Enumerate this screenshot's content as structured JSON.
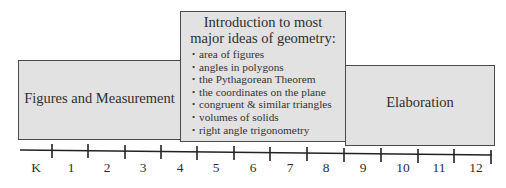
{
  "diagram": {
    "type": "timeline-with-stage-boxes",
    "colors": {
      "box_fill": "#e2e2e2",
      "box_border": "#4a4a4a",
      "line": "#222222",
      "text": "#2e2e2e"
    },
    "stages": [
      {
        "id": "figures-and-measurement",
        "title": "Figures and Measurement",
        "grade_span": [
          "K",
          "4"
        ]
      },
      {
        "id": "introduction",
        "heading_line1": "Introduction to most",
        "heading_line2": "major ideas of geometry:",
        "grade_span": [
          "5",
          "8"
        ],
        "bullets": [
          "area of figures",
          "angles in polygons",
          "the Pythagorean Theorem",
          "the coordinates on the plane",
          "congruent & similar triangles",
          "volumes of solids",
          "right angle trigonometry"
        ]
      },
      {
        "id": "elaboration",
        "title": "Elaboration",
        "grade_span": [
          "9",
          "12"
        ]
      }
    ],
    "bullet_glyph": "•",
    "timeline": {
      "labels": [
        "K",
        "1",
        "2",
        "3",
        "4",
        "5",
        "6",
        "7",
        "8",
        "9",
        "10",
        "11",
        "12"
      ]
    }
  }
}
